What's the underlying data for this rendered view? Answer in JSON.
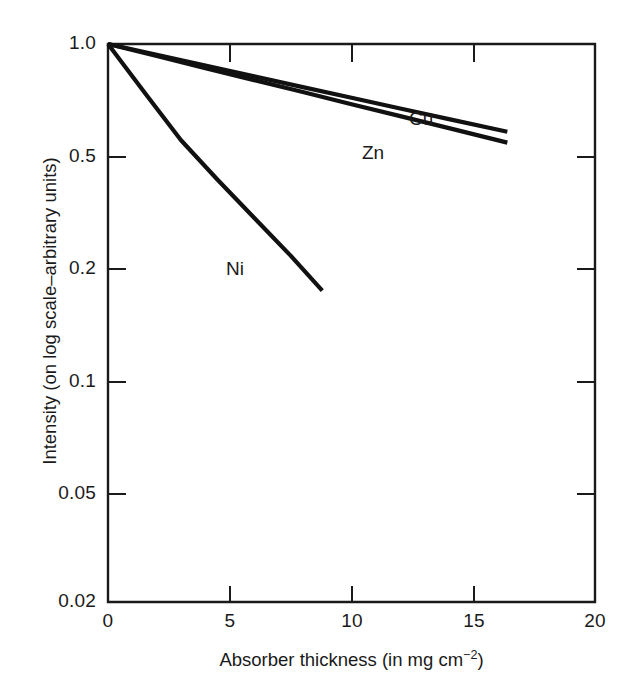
{
  "figure": {
    "background_color": "#ffffff",
    "ink_color": "#111111"
  },
  "chart_data": {
    "type": "line",
    "title": "",
    "subtitle": "",
    "xlabel_parts": {
      "main": "Absorber thickness (in mg cm",
      "exponent": "−2",
      "tail": ")"
    },
    "xlabel": "Absorber thickness (in mg cm-2)",
    "ylabel": "Intensity (on log scale–arbitrary units)",
    "yscale": "log",
    "grid": false,
    "legend_position": "inline-annotations",
    "xlim": [
      0,
      20
    ],
    "ylim": [
      0.02,
      1.0
    ],
    "xticks": [
      0,
      5,
      10,
      15,
      20
    ],
    "xticklabels": [
      "0",
      "5",
      "10",
      "15",
      "20"
    ],
    "yticks": [
      1.0,
      0.5,
      0.2,
      0.1,
      0.05,
      0.02
    ],
    "yticklabels": [
      "1.0",
      "0.5",
      "0.2",
      "0.1",
      "0.05",
      "0.02"
    ],
    "series": [
      {
        "name": "Cu",
        "label": "Cu",
        "x": [
          0.0,
          2.0,
          4.0,
          6.0,
          8.0,
          10.0,
          12.0,
          14.0,
          16.4
        ],
        "y": [
          1.0,
          0.935,
          0.875,
          0.818,
          0.765,
          0.716,
          0.67,
          0.627,
          0.58
        ]
      },
      {
        "name": "Zn",
        "label": "Zn",
        "x": [
          0.0,
          2.0,
          4.0,
          6.0,
          8.0,
          10.0,
          12.0,
          14.0,
          16.4
        ],
        "y": [
          1.0,
          0.928,
          0.861,
          0.799,
          0.742,
          0.688,
          0.639,
          0.593,
          0.542
        ]
      },
      {
        "name": "Ni",
        "label": "Ni",
        "x": [
          0.0,
          1.5,
          3.0,
          4.5,
          6.0,
          7.5,
          8.8
        ],
        "y": [
          1.0,
          0.74,
          0.55,
          0.41,
          0.3,
          0.22,
          0.173
        ]
      }
    ],
    "annotations": [
      {
        "text": "Cu",
        "x": 12.6,
        "y": 0.718
      },
      {
        "text": "Zn",
        "x": 10.5,
        "y": 0.555
      },
      {
        "text": "Ni",
        "x": 3.6,
        "y": 0.352
      }
    ]
  }
}
